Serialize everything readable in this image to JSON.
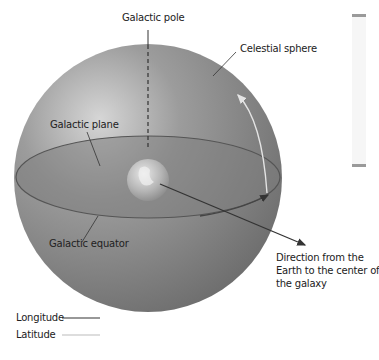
{
  "diagram": {
    "labels": {
      "galactic_pole": "Galactic pole",
      "celestial_sphere": "Celestial sphere",
      "galactic_plane": "Galactic plane",
      "galactic_equator": "Galactic equator",
      "direction_line1": "Direction from the",
      "direction_line2": "Earth to the center of",
      "direction_line3": "the galaxy"
    },
    "legend": [
      {
        "label": "Longitude",
        "color": "#333333"
      },
      {
        "label": "Latitude",
        "color": "#bbbbbb"
      }
    ],
    "colors": {
      "sphere_dark": "#6e6e6e",
      "sphere_light": "#cfcfcf",
      "plane": "#7c7c7c",
      "longitude_line": "#333333",
      "latitude_line": "#e0e0e0"
    }
  }
}
